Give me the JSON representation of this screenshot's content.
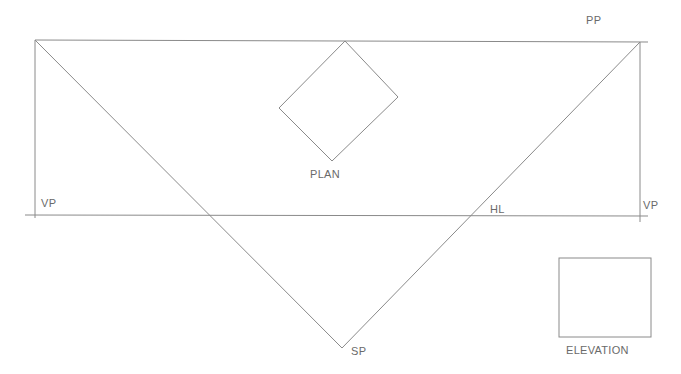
{
  "labels": {
    "pp": "PP",
    "plan": "PLAN",
    "vp_left": "VP",
    "vp_right": "VP",
    "hl": "HL",
    "sp": "SP",
    "elevation": "ELEVATION"
  },
  "colors": {
    "line": "#8a8a8a",
    "text": "#6a6a6a",
    "background": "#ffffff"
  }
}
